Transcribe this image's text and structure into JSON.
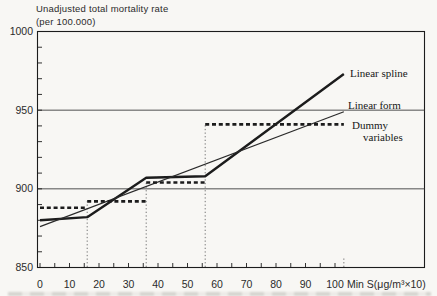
{
  "title": {
    "line1": "Unadjusted total mortality rate",
    "line2": "(per 100.000)"
  },
  "colors": {
    "ink": "#1c1c1c",
    "thin_line": "#2a2a2a",
    "grid": "#3d3d3d",
    "dotted": "#757575",
    "paper": "#f8f7f4",
    "text": "#2b2b2b"
  },
  "chart_data": {
    "type": "line",
    "title": "Unadjusted total mortality rate (per 100.000)",
    "ylabel": "Unadjusted total mortality rate (per 100.000)",
    "xlabel": "Min S(μg/m³×10)",
    "xlim": [
      0,
      131
    ],
    "ylim": [
      850,
      1000
    ],
    "x_ticks": [
      0,
      10,
      20,
      30,
      40,
      50,
      60,
      70,
      80,
      90,
      100
    ],
    "x_minor_step": 5,
    "y_ticks": [
      1000,
      950,
      900,
      850
    ],
    "y_minor_step": 10,
    "gridlines_y": [
      950,
      900
    ],
    "grid": "horizontal-only",
    "legend_position": "right-inline",
    "legend": {
      "spline": "Linear spline",
      "form": "Linear form",
      "dummy_line1": "Dummy",
      "dummy_line2": "variables"
    },
    "series": [
      {
        "name": "Linear spline",
        "style": "solid-thick",
        "points": [
          [
            0,
            880
          ],
          [
            16,
            882
          ],
          [
            36,
            907
          ],
          [
            56,
            908
          ],
          [
            103,
            973
          ]
        ]
      },
      {
        "name": "Linear form",
        "style": "solid-thin",
        "points": [
          [
            0,
            876
          ],
          [
            103,
            949
          ]
        ]
      },
      {
        "name": "Dummy variables",
        "style": "dashed-steps",
        "steps": [
          {
            "x1": 0,
            "x2": 16,
            "y": 888
          },
          {
            "x1": 16,
            "x2": 36,
            "y": 892
          },
          {
            "x1": 36,
            "x2": 56,
            "y": 904
          },
          {
            "x1": 56,
            "x2": 103,
            "y": 941
          }
        ]
      }
    ],
    "breakpoint_dotted_lines": [
      {
        "x": 16,
        "y_top": 892
      },
      {
        "x": 36,
        "y_top": 904
      },
      {
        "x": 56,
        "y_top": 941
      },
      {
        "x": 103,
        "y_top": 856
      }
    ]
  }
}
